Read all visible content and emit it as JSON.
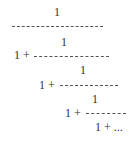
{
  "continued_fraction": {
    "rows": [
      {
        "numerator": "1",
        "prefix": "",
        "bar": "-------------------"
      },
      {
        "numerator": "1",
        "prefix": "1 +",
        "bar": "-----------------"
      },
      {
        "numerator": "1",
        "prefix": "1 +",
        "bar": "--------------"
      },
      {
        "numerator": "1",
        "prefix": "1 +",
        "bar": "----------"
      }
    ],
    "tail": "1 + ..."
  }
}
